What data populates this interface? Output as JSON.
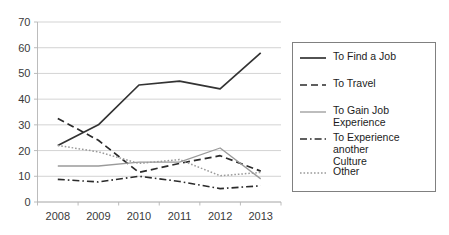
{
  "chart_data": {
    "type": "line",
    "title": "",
    "xlabel": "",
    "ylabel": "",
    "categories": [
      "2008",
      "2009",
      "2010",
      "2011",
      "2012",
      "2013"
    ],
    "ylim": [
      0,
      70
    ],
    "ytick_step": 10,
    "yticks": [
      "0",
      "10",
      "20",
      "30",
      "40",
      "50",
      "60",
      "70"
    ],
    "grid": true,
    "legend_position": "right",
    "series": [
      {
        "name": "To Find a Job",
        "values": [
          22,
          30,
          45.5,
          47,
          44,
          58
        ],
        "style": "solid",
        "color": "#333333",
        "width": 1.7
      },
      {
        "name": "To Travel",
        "values": [
          32.5,
          24,
          11.5,
          15,
          18,
          12
        ],
        "style": "dashed",
        "color": "#2b2b2b",
        "width": 1.7
      },
      {
        "name": "To Gain Job Experience",
        "values": [
          14,
          14,
          15.5,
          15.5,
          21,
          9
        ],
        "style": "solid",
        "color": "#9a9a9a",
        "width": 1.3
      },
      {
        "name": "To Experience another Culture",
        "values": [
          8.8,
          7.8,
          10,
          8,
          5.2,
          6.3
        ],
        "style": "dashdot",
        "color": "#2b2b2b",
        "width": 1.6
      },
      {
        "name": "Other",
        "values": [
          22,
          19.5,
          15,
          16.5,
          10.2,
          11.5
        ],
        "style": "dotted",
        "color": "#9a9a9a",
        "width": 1.5
      }
    ]
  },
  "legend": {
    "items": [
      {
        "label": "To Find a Job",
        "style": "solid",
        "color": "#333333"
      },
      {
        "label": "To Travel",
        "style": "dashed",
        "color": "#2b2b2b"
      },
      {
        "label": "To Gain Job Experience",
        "style": "solid",
        "color": "#9a9a9a"
      },
      {
        "label": "To Experience another\nCulture",
        "style": "dashdot",
        "color": "#2b2b2b"
      },
      {
        "label": "Other",
        "style": "dotted",
        "color": "#9a9a9a"
      }
    ]
  },
  "colors": {
    "background": "#ffffff",
    "gridline": "#c8c8c8",
    "axis": "#b4b4b4",
    "text": "#3a3a3a",
    "legend_border": "#808080"
  }
}
